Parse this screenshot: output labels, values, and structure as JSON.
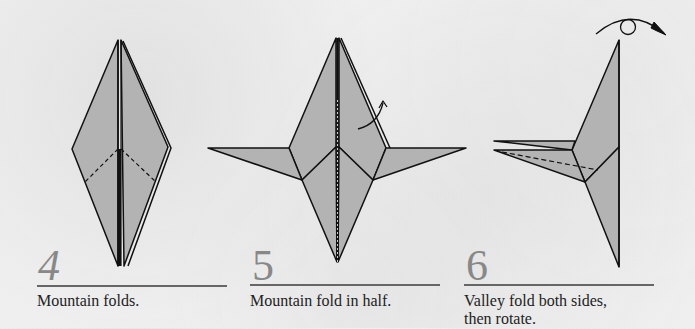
{
  "colors": {
    "paper_fill": "#b3b3b3",
    "stroke": "#111111",
    "number": "#888888",
    "rule": "#666666",
    "caption": "#222222"
  },
  "steps": [
    {
      "number": "4",
      "caption": "Mountain folds."
    },
    {
      "number": "5",
      "caption": "Mountain fold in half."
    },
    {
      "number": "6",
      "caption_line1": "Valley fold both sides,",
      "caption_line2": "then rotate."
    }
  ]
}
